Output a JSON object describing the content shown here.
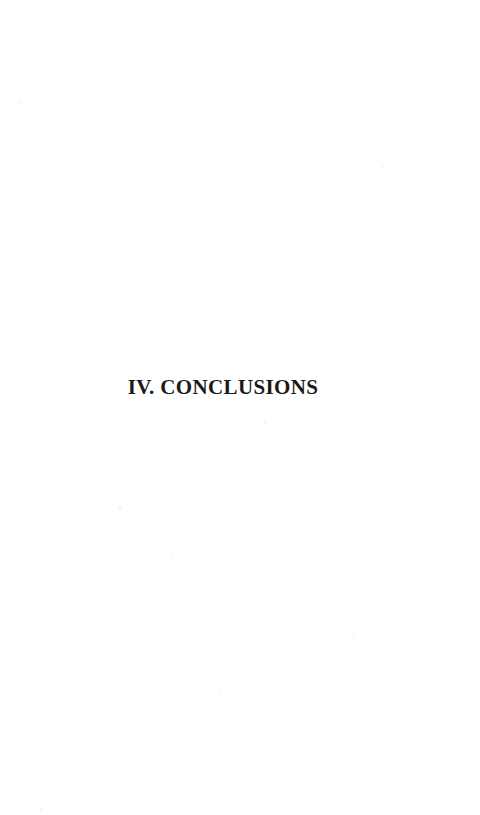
{
  "document": {
    "page_background_color": "#ffffff",
    "ink_color": "#1a1a1a",
    "page_width": 480,
    "page_height": 815
  },
  "heading": {
    "numeral": "IV.",
    "title": "CONCLUSIONS",
    "full_text": "IV. CONCLUSIONS"
  },
  "body": {
    "content": ""
  }
}
